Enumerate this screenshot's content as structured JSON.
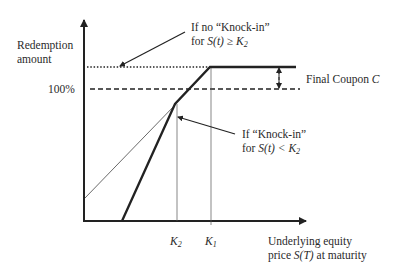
{
  "diagram": {
    "y_axis_label_line1": "Redemption",
    "y_axis_label_line2": "amount",
    "level_100": "100%",
    "annotation_no_knockin_line1": "If no “Knock-in”",
    "annotation_no_knockin_line2_prefix": "for ",
    "annotation_no_knockin_line2_expr": "S(t) ≥ K",
    "annotation_no_knockin_line2_sub": "2",
    "annotation_knockin_line1": "If “Knock-in”",
    "annotation_knockin_line2_prefix": "for ",
    "annotation_knockin_line2_expr": "S(t) < K",
    "annotation_knockin_line2_sub": "2",
    "final_coupon_text": "Final Coupon ",
    "final_coupon_symbol": "C",
    "k2_label": "K",
    "k2_sub": "2",
    "k1_label": "K",
    "k1_sub": "1",
    "x_axis_label_line1": "Underlying equity",
    "x_axis_label_line2_prefix": "price ",
    "x_axis_label_line2_expr": "S(T)",
    "x_axis_label_line2_suffix": " at maturity"
  },
  "colors": {
    "ink": "#222222",
    "background": "#ffffff"
  }
}
